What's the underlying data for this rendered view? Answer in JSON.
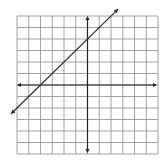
{
  "chart_data": {
    "type": "line",
    "title": "",
    "xlabel": "",
    "ylabel": "",
    "xlim": [
      -6,
      6
    ],
    "ylim": [
      -6,
      6
    ],
    "grid": true,
    "grid_step": 1,
    "axes_arrows": true,
    "tick_labels": [],
    "legend": [],
    "series": [
      {
        "name": "y = x + 4",
        "slope": 1,
        "intercept": 4,
        "x": [
          -6.5,
          2.6
        ],
        "y": [
          -2.5,
          6.6
        ],
        "arrows_both_ends": true
      }
    ],
    "annotations": []
  },
  "style": {
    "grid_color": "#8a8a8a",
    "axis_color": "#222222",
    "line_color": "#222222",
    "background": "#ffffff"
  },
  "layout": {
    "plot_left": 17,
    "plot_top": 16,
    "plot_right": 158,
    "plot_bottom": 154,
    "origin_x": 88,
    "origin_y": 86
  }
}
